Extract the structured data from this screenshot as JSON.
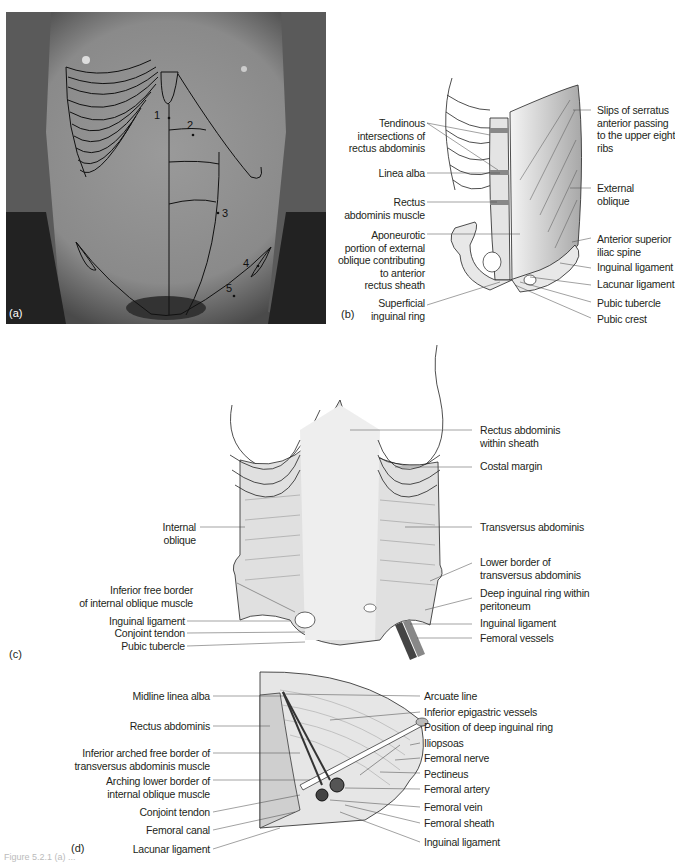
{
  "panel_a": {
    "label": "(a)",
    "numbers": [
      "1",
      "2",
      "3",
      "4",
      "5"
    ]
  },
  "panel_b": {
    "label": "(b)",
    "left_labels": [
      [
        "Tendinous",
        "intersections of",
        "rectus abdominis"
      ],
      [
        "Linea alba"
      ],
      [
        "Rectus",
        "abdominis muscle"
      ],
      [
        "Aponeurotic",
        "portion of external",
        "oblique contributing",
        "to anterior",
        "rectus sheath"
      ],
      [
        "Superficial",
        "inguinal ring"
      ]
    ],
    "right_labels": [
      [
        "Slips of serratus",
        "anterior passing",
        "to the upper eight",
        "ribs"
      ],
      [
        "External",
        "oblique"
      ],
      [
        "Anterior superior",
        "iliac spine"
      ],
      [
        "Inguinal ligament"
      ],
      [
        "Lacunar ligament"
      ],
      [
        "Pubic tubercle"
      ],
      [
        "Pubic crest"
      ]
    ]
  },
  "panel_c": {
    "label": "(c)",
    "left_labels": [
      [
        "Internal",
        "oblique"
      ],
      [
        "Inferior free border",
        "of internal oblique muscle"
      ],
      [
        "Inguinal ligament"
      ],
      [
        "Conjoint tendon"
      ],
      [
        "Pubic tubercle"
      ]
    ],
    "right_labels": [
      [
        "Rectus abdominis",
        "within sheath"
      ],
      [
        "Costal margin"
      ],
      [
        "Transversus abdominis"
      ],
      [
        "Lower border of",
        "transversus abdominis"
      ],
      [
        "Deep inguinal ring within",
        "peritoneum"
      ],
      [
        "Inguinal ligament"
      ],
      [
        "Femoral vessels"
      ]
    ]
  },
  "panel_d": {
    "label": "(d)",
    "left_labels": [
      [
        "Midline linea alba"
      ],
      [
        "Rectus abdominis"
      ],
      [
        "Inferior arched free border of",
        "transversus abdominis muscle"
      ],
      [
        "Arching lower border of",
        "internal oblique muscle"
      ],
      [
        "Conjoint tendon"
      ],
      [
        "Femoral canal"
      ],
      [
        "Lacunar ligament"
      ]
    ],
    "right_labels": [
      [
        "Arcuate line"
      ],
      [
        "Inferior epigastric vessels"
      ],
      [
        "Position of deep inguinal ring"
      ],
      [
        "Iliopsoas"
      ],
      [
        "Femoral nerve"
      ],
      [
        "Pectineus"
      ],
      [
        "Femoral artery"
      ],
      [
        "Femoral vein"
      ],
      [
        "Femoral sheath"
      ],
      [
        "Inguinal ligament"
      ]
    ]
  },
  "caption": "Figure 5.2.1 (a) ..."
}
